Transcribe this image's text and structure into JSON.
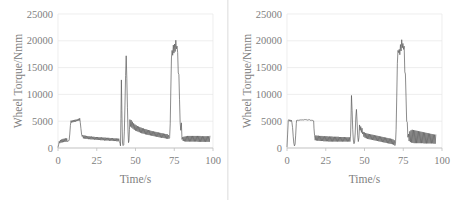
{
  "figure": {
    "panel_count": 2,
    "background_color": "#ffffff",
    "line_color": "#5a5a5a",
    "grid_color": "#e6e6e6",
    "axis_color": "#bfbfbf",
    "tick_text_color": "#808080"
  },
  "chart_data": [
    {
      "type": "line",
      "title": "",
      "xlabel": "Time/s",
      "ylabel": "Wheel Torque/Nmm",
      "xlim": [
        0,
        100
      ],
      "ylim": [
        0,
        25000
      ],
      "xticks": [
        0,
        25,
        50,
        75,
        100
      ],
      "yticks": [
        0,
        5000,
        10000,
        15000,
        20000,
        25000
      ],
      "xtick_labels": [
        "0",
        "25",
        "50",
        "75",
        "100"
      ],
      "ytick_labels": [
        "0",
        "5000",
        "10000",
        "15000",
        "20000",
        "25000"
      ],
      "grid": "horizontal",
      "legend": "none",
      "series": [
        {
          "name": "Wheel Torque",
          "x": [
            0,
            0.4,
            0.8,
            1.2,
            1.6,
            2,
            2.4,
            2.8,
            3.2,
            3.6,
            4,
            4.4,
            4.8,
            5.2,
            5.6,
            6,
            6.4,
            6.8,
            7.2,
            7.6,
            8,
            8.4,
            8.8,
            9.2,
            9.6,
            10,
            10.4,
            10.8,
            11.2,
            11.6,
            12,
            12.4,
            12.8,
            13.2,
            13.6,
            14,
            14.4,
            14.8,
            15.2,
            15.6,
            16,
            16.4,
            16.8,
            17.2,
            17.6,
            18,
            18.4,
            18.8,
            19.2,
            19.6,
            20,
            20.4,
            20.8,
            21.2,
            21.6,
            22,
            22.4,
            22.8,
            23.2,
            23.6,
            24,
            24.4,
            24.8,
            25.2,
            25.6,
            26,
            26.4,
            26.8,
            27.2,
            27.6,
            28,
            28.4,
            28.8,
            29.2,
            29.6,
            30,
            30.4,
            30.8,
            31.2,
            31.6,
            32,
            32.4,
            32.8,
            33.2,
            33.6,
            34,
            34.4,
            34.8,
            35.2,
            35.6,
            36,
            36.4,
            36.8,
            37.2,
            37.6,
            38,
            38.4,
            38.8,
            39.2,
            39.6,
            40,
            40.3,
            40.6,
            40.9,
            41.2,
            41.6,
            42,
            42.4,
            42.8,
            43.2,
            43.6,
            44,
            44.4,
            44.8,
            45.2,
            45.5,
            45.8,
            46.1,
            46.4,
            46.8,
            47.2,
            47.6,
            48,
            48.4,
            48.8,
            49.2,
            49.6,
            50,
            50.4,
            50.8,
            51.2,
            51.6,
            52,
            52.4,
            52.8,
            53.2,
            53.6,
            54,
            54.4,
            54.8,
            55.2,
            55.6,
            56,
            56.4,
            56.8,
            57.2,
            57.6,
            58,
            58.4,
            58.8,
            59.2,
            59.6,
            60,
            60.4,
            60.8,
            61.2,
            61.6,
            62,
            62.4,
            62.8,
            63.2,
            63.6,
            64,
            64.4,
            64.8,
            65.2,
            65.6,
            66,
            66.4,
            66.8,
            67.2,
            67.6,
            68,
            68.4,
            68.8,
            69.2,
            69.6,
            70,
            70.4,
            70.8,
            71.2,
            71.6,
            72,
            72.4,
            72.8,
            73.2,
            73.6,
            74,
            74.4,
            74.8,
            75.2,
            75.6,
            76,
            76.4,
            76.8,
            77.2,
            77.6,
            78,
            78.4,
            78.8,
            79.2,
            79.6,
            80,
            80.4,
            80.8,
            81.2,
            81.6,
            82,
            82.4,
            82.8,
            83.2,
            83.6,
            84,
            84.4,
            84.8,
            85.2,
            85.6,
            86,
            86.4,
            86.8,
            87.2,
            87.6,
            88,
            88.4,
            88.8,
            89.2,
            89.6,
            90,
            90.4,
            90.8,
            91.2,
            91.6,
            92,
            92.4,
            92.8,
            93.2,
            93.6,
            94,
            94.4,
            94.8,
            95.2,
            95.6,
            96,
            96.4,
            96.8,
            97.2,
            97.6,
            98
          ],
          "y": [
            150,
            600,
            1250,
            900,
            1500,
            1000,
            1600,
            1050,
            1700,
            1100,
            1750,
            1150,
            1800,
            1150,
            1800,
            1200,
            1250,
            1300,
            1500,
            2600,
            4200,
            5100,
            4750,
            5150,
            4800,
            5200,
            4850,
            5250,
            4900,
            5300,
            5000,
            5350,
            5050,
            5450,
            5100,
            5550,
            4700,
            3600,
            2600,
            2150,
            2400,
            1800,
            2350,
            1750,
            2300,
            1700,
            2250,
            1700,
            2200,
            1650,
            2200,
            1650,
            2150,
            1600,
            2150,
            1600,
            2100,
            1600,
            2100,
            1550,
            2050,
            1550,
            2050,
            1500,
            2050,
            1500,
            2000,
            1500,
            2000,
            1450,
            2000,
            1450,
            1950,
            1450,
            1950,
            1400,
            1950,
            1400,
            1900,
            1400,
            1900,
            1400,
            1900,
            1350,
            1850,
            1350,
            1850,
            1350,
            1850,
            1300,
            1800,
            1300,
            1800,
            1300,
            1800,
            1250,
            1750,
            1250,
            1750,
            1200,
            900,
            400,
            5500,
            12700,
            7000,
            900,
            450,
            600,
            3000,
            8000,
            13500,
            17200,
            13000,
            7500,
            3000,
            1000,
            1400,
            3400,
            5300,
            4000,
            5200,
            3800,
            4900,
            3600,
            4600,
            3400,
            4400,
            3250,
            4250,
            3150,
            4100,
            3050,
            4000,
            2950,
            3900,
            2850,
            3800,
            2750,
            3700,
            2700,
            3650,
            2650,
            3550,
            2550,
            3500,
            2500,
            3400,
            2450,
            3350,
            2400,
            3300,
            2350,
            3200,
            2300,
            3150,
            2250,
            3100,
            2200,
            3050,
            2150,
            3000,
            2100,
            2950,
            2050,
            2900,
            2000,
            2850,
            1950,
            2800,
            1900,
            2750,
            1900,
            2700,
            1850,
            2650,
            1800,
            2600,
            1750,
            2600,
            1700,
            2400,
            1750,
            1900,
            4500,
            11000,
            16800,
            18200,
            17300,
            19200,
            17700,
            19400,
            18000,
            20100,
            18500,
            19000,
            17800,
            14000,
            13700,
            9000,
            4800,
            3300,
            4700,
            1600,
            2000,
            1300,
            2100,
            1250,
            2150,
            1200,
            2200,
            1200,
            2250,
            1200,
            2250,
            1200,
            2250,
            1200,
            2250,
            1200,
            2250,
            1200,
            2250,
            1200,
            2250,
            1200,
            2250,
            1200,
            2250,
            1150,
            2250,
            1150,
            2250,
            1150,
            2200,
            1150,
            2200,
            1150,
            2200,
            1150,
            2200,
            1150,
            2200,
            1150,
            2200,
            1150,
            2200,
            1150,
            2200
          ]
        }
      ]
    },
    {
      "type": "line",
      "title": "",
      "xlabel": "Time/s",
      "ylabel": "Wheel Torque/Nmm",
      "xlim": [
        0,
        100
      ],
      "ylim": [
        0,
        25000
      ],
      "xticks": [
        0,
        25,
        50,
        75,
        100
      ],
      "yticks": [
        0,
        5000,
        10000,
        15000,
        20000,
        25000
      ],
      "xtick_labels": [
        "0",
        "25",
        "50",
        "75",
        "100"
      ],
      "ytick_labels": [
        "0",
        "5000",
        "10000",
        "15000",
        "20000",
        "25000"
      ],
      "grid": "horizontal",
      "legend": "none",
      "series": [
        {
          "name": "Wheel Torque",
          "x": [
            0,
            0.4,
            0.8,
            1.2,
            1.6,
            2,
            2.4,
            2.8,
            3.2,
            3.6,
            4,
            4.4,
            4.8,
            5.2,
            5.6,
            6,
            6.2,
            6.5,
            6.8,
            7.2,
            7.6,
            8,
            8.4,
            8.8,
            9.2,
            9.6,
            10,
            10.4,
            10.8,
            11.2,
            11.6,
            12,
            12.4,
            12.8,
            13.2,
            13.6,
            14,
            14.4,
            14.8,
            15.2,
            15.6,
            16,
            16.4,
            16.8,
            17.2,
            17.4,
            17.8,
            18.2,
            18.6,
            19,
            19.4,
            19.8,
            20.2,
            20.6,
            21,
            21.4,
            21.8,
            22.2,
            22.6,
            23,
            23.4,
            23.8,
            24.2,
            24.6,
            25,
            25.4,
            25.8,
            26.2,
            26.6,
            27,
            27.4,
            27.8,
            28.2,
            28.6,
            29,
            29.4,
            29.8,
            30.2,
            30.6,
            31,
            31.4,
            31.8,
            32.2,
            32.6,
            33,
            33.4,
            33.8,
            34.2,
            34.6,
            35,
            35.4,
            35.8,
            36.2,
            36.6,
            37,
            37.4,
            37.8,
            38.2,
            38.6,
            39,
            39.4,
            39.8,
            40.2,
            40.6,
            41,
            41.3,
            41.6,
            42,
            42.4,
            42.8,
            43.2,
            43.6,
            44,
            44.4,
            44.8,
            45.2,
            45.6,
            46,
            46.4,
            46.8,
            47.2,
            47.6,
            48,
            48.4,
            48.8,
            49.2,
            49.6,
            50,
            50.4,
            50.8,
            51.2,
            51.6,
            52,
            52.4,
            52.8,
            53.2,
            53.6,
            54,
            54.4,
            54.8,
            55.2,
            55.6,
            56,
            56.4,
            56.8,
            57.2,
            57.6,
            58,
            58.4,
            58.8,
            59.2,
            59.6,
            60,
            60.4,
            60.8,
            61.2,
            61.6,
            62,
            62.4,
            62.8,
            63.2,
            63.6,
            64,
            64.4,
            64.8,
            65.2,
            65.6,
            66,
            66.4,
            66.8,
            67.2,
            67.6,
            68,
            68.4,
            68.8,
            69.2,
            69.6,
            70,
            70.4,
            70.8,
            71.2,
            71.6,
            72,
            72.4,
            72.8,
            73.2,
            73.6,
            74,
            74.4,
            74.8,
            75.2,
            75.6,
            76,
            76.4,
            76.8,
            77.2,
            77.6,
            78,
            78.4,
            78.8,
            79.2,
            79.6,
            80,
            80.4,
            80.8,
            81.2,
            81.6,
            82,
            82.4,
            82.8,
            83.2,
            83.6,
            84,
            84.4,
            84.8,
            85.2,
            85.6,
            86,
            86.4,
            86.8,
            87.2,
            87.6,
            88,
            88.4,
            88.8,
            89.2,
            89.6,
            90,
            90.4,
            90.8,
            91.2,
            91.6,
            92,
            92.4,
            92.8,
            93.2,
            93.6,
            94,
            94.4,
            94.8,
            95.2,
            95.6,
            96
          ],
          "y": [
            200,
            2600,
            5100,
            5300,
            5000,
            5250,
            4950,
            5200,
            4700,
            3800,
            2200,
            900,
            400,
            700,
            2400,
            4600,
            5150,
            5200,
            5150,
            5250,
            5100,
            5200,
            5150,
            5250,
            5200,
            5300,
            5250,
            5300,
            5200,
            5300,
            5250,
            5300,
            5250,
            5300,
            5200,
            5300,
            5250,
            5300,
            5200,
            5150,
            5250,
            5100,
            5150,
            5100,
            5050,
            3700,
            2300,
            1450,
            2350,
            1400,
            2300,
            1350,
            2300,
            1350,
            2250,
            1300,
            2250,
            1300,
            2250,
            1300,
            2200,
            1250,
            2200,
            1250,
            2200,
            1250,
            2200,
            1250,
            2150,
            1200,
            2150,
            1200,
            2150,
            1200,
            2150,
            1200,
            2100,
            1200,
            2100,
            1200,
            2100,
            1200,
            2100,
            1200,
            2100,
            1200,
            2050,
            1200,
            2050,
            1200,
            2050,
            1200,
            2050,
            1200,
            2050,
            1200,
            2000,
            1200,
            2000,
            1200,
            2000,
            1200,
            2000,
            1200,
            2200,
            5800,
            9800,
            7000,
            3500,
            1500,
            800,
            1100,
            2800,
            5800,
            7200,
            5000,
            2400,
            1200,
            1900,
            4300,
            3300,
            4000,
            2900,
            3700,
            2600,
            3000,
            2100,
            2900,
            1900,
            2800,
            1800,
            2700,
            1700,
            2650,
            1650,
            2600,
            1600,
            2550,
            1550,
            2500,
            1500,
            2450,
            1450,
            2400,
            1400,
            2350,
            1350,
            2300,
            1300,
            2250,
            1250,
            2200,
            1200,
            2150,
            1150,
            2100,
            1100,
            2050,
            1050,
            2000,
            1000,
            1950,
            950,
            1900,
            900,
            1850,
            850,
            1800,
            800,
            1750,
            750,
            1700,
            700,
            1600,
            600,
            1450,
            450,
            900,
            3500,
            9500,
            15800,
            18200,
            17800,
            18400,
            17400,
            19300,
            18100,
            20200,
            18700,
            19500,
            18400,
            19000,
            14200,
            13800,
            9500,
            5000,
            4800,
            2000,
            2600,
            1300,
            3100,
            1100,
            3300,
            1000,
            3400,
            950,
            3350,
            900,
            3300,
            900,
            3250,
            900,
            3200,
            900,
            3150,
            900,
            3100,
            900,
            3050,
            900,
            3000,
            900,
            2950,
            850,
            2900,
            850,
            2850,
            850,
            2800,
            850,
            2750,
            850,
            2700,
            850,
            2650,
            850,
            2600,
            850,
            2550,
            800,
            2500,
            800,
            2450
          ]
        }
      ]
    }
  ]
}
